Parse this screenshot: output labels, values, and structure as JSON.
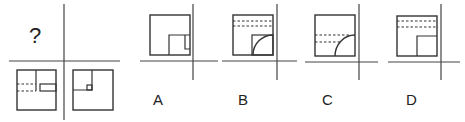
{
  "question": {
    "mark": "?",
    "grid": {
      "vertical_line_x": 64,
      "horizontal_line_y": 61
    },
    "panels": [
      {
        "position": "top-left",
        "content": "question-mark"
      },
      {
        "position": "top-right",
        "content": "empty"
      },
      {
        "position": "bottom-left",
        "content": "square with inner vertical line, small rectangle on right edge, two dashed lines on left"
      },
      {
        "position": "bottom-right",
        "content": "square with small inner square quadrant and tiny square in corner"
      }
    ]
  },
  "options": [
    {
      "label": "A",
      "content": "square with lower-right inner square containing narrow rectangle"
    },
    {
      "label": "B",
      "content": "square with two dashed lines at top and lower-right inner square with arc"
    },
    {
      "label": "C",
      "content": "square with two dashed lines in middle and arc in lower-right corner"
    },
    {
      "label": "D",
      "content": "square with two dashed lines at top and lower-right inner square"
    }
  ],
  "colors": {
    "line": "#333333",
    "background": "#ffffff"
  }
}
